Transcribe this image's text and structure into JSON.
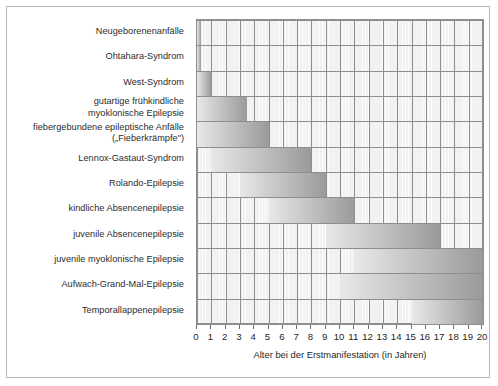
{
  "chart_data": {
    "type": "bar",
    "orientation": "horizontal",
    "title": "",
    "subtitle": "",
    "xlabel": "Alter bei der Erstmanifestation (in Jahren)",
    "ylabel": "",
    "xlim": [
      0,
      20
    ],
    "xticks": [
      "0",
      "1",
      "2",
      "3",
      "4",
      "5",
      "6",
      "7",
      "8",
      "9",
      "10",
      "11",
      "12",
      "13",
      "14",
      "15",
      "16",
      "17",
      "18",
      "19",
      "20"
    ],
    "grid": true,
    "legend": null,
    "value_unit": "Jahre",
    "note": "Jeder Balken zeigt den Altersbereich (Beginn bis Ende) der Erstmanifestation.",
    "categories": [
      "Neugeborenenanfälle",
      "Ohtahara-Syndrom",
      "West-Syndrom",
      "gutartige frühkindliche myoklonische Epilepsie",
      "fiebergebundene epileptische Anfälle („Fieberkrämpfe\")",
      "Lennox-Gastaut-Syndrom",
      "Rolando-Epilepsie",
      "kindliche Absencenepilepsie",
      "juvenile Absencenepilepsie",
      "juvenile myoklonische Epilepsie",
      "Aufwach-Grand-Mal-Epilepsie",
      "Temporallappenepilepsie"
    ],
    "bars": [
      {
        "label": "Neugeborenenanfälle",
        "label_lines": [
          "Neugeborenenanfälle"
        ],
        "start": 0.0,
        "end": 0.3
      },
      {
        "label": "Ohtahara-Syndrom",
        "label_lines": [
          "Ohtahara-Syndrom"
        ],
        "start": 0.0,
        "end": 0.3
      },
      {
        "label": "West-Syndrom",
        "label_lines": [
          "West-Syndrom"
        ],
        "start": 0.0,
        "end": 1.0
      },
      {
        "label": "gutartige frühkindliche myoklonische Epilepsie",
        "label_lines": [
          "gutartige frühkindliche",
          "myoklonische Epilepsie"
        ],
        "start": 0.0,
        "end": 3.5
      },
      {
        "label": "fiebergebundene epileptische Anfälle („Fieberkrämpfe\")",
        "label_lines": [
          "fiebergebundene epileptische Anfälle",
          "(„Fieberkrämpfe\")"
        ],
        "start": 0.0,
        "end": 5.0
      },
      {
        "label": "Lennox-Gastaut-Syndrom",
        "label_lines": [
          "Lennox-Gastaut-Syndrom"
        ],
        "start": 1.0,
        "end": 8.0
      },
      {
        "label": "Rolando-Epilepsie",
        "label_lines": [
          "Rolando-Epilepsie"
        ],
        "start": 3.0,
        "end": 9.0
      },
      {
        "label": "kindliche Absencenepilepsie",
        "label_lines": [
          "kindliche Absencenepilepsie"
        ],
        "start": 5.0,
        "end": 11.0
      },
      {
        "label": "juvenile Absencenepilepsie",
        "label_lines": [
          "juvenile Absencenepilepsie"
        ],
        "start": 9.0,
        "end": 17.0
      },
      {
        "label": "juvenile myoklonische Epilepsie",
        "label_lines": [
          "juvenile myoklonische Epilepsie"
        ],
        "start": 11.0,
        "end": 20.0
      },
      {
        "label": "Aufwach-Grand-Mal-Epilepsie",
        "label_lines": [
          "Aufwach-Grand-Mal-Epilepsie"
        ],
        "start": 10.0,
        "end": 20.0
      },
      {
        "label": "Temporallappenepilepsie",
        "label_lines": [
          "Temporallappenepilepsie"
        ],
        "start": 15.0,
        "end": 20.0
      }
    ],
    "colors": {
      "bar_gradient_start": "#e8e8e8",
      "bar_gradient_end": "#9a9a9a",
      "plot_background": "#f2f2f2",
      "grid_line": "#8e8e8e",
      "frame": "#b8b8b8",
      "text": "#1f1f1f"
    }
  }
}
